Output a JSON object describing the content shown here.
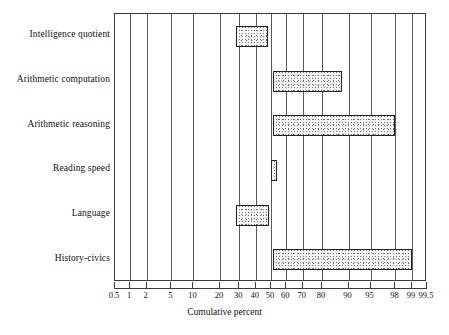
{
  "chart_data": {
    "type": "bar",
    "orientation": "horizontal",
    "title": "",
    "xlabel": "Cumulative percent",
    "ylabel": "",
    "scale": "normal-probability (probit)",
    "xlim": [
      0.5,
      99.5
    ],
    "grid": true,
    "legend": null,
    "xticks": [
      "0.5",
      "1",
      "2",
      "5",
      "10",
      "20",
      "30",
      "40",
      "50",
      "60",
      "70",
      "80",
      "90",
      "95",
      "98",
      "99",
      "99.5"
    ],
    "xtick_values": [
      0.5,
      1,
      2,
      5,
      10,
      20,
      30,
      40,
      50,
      60,
      70,
      80,
      90,
      95,
      98,
      99,
      99.5
    ],
    "categories": [
      "Intelligence quotient",
      "Arithmetic computation",
      "Arithmetic  reasoning",
      "Reading speed",
      "Language",
      "History-civics"
    ],
    "bars": [
      {
        "category": "Intelligence quotient",
        "start": 28,
        "end": 48
      },
      {
        "category": "Arithmetic computation",
        "start": 51,
        "end": 88
      },
      {
        "category": "Arithmetic  reasoning",
        "start": 51,
        "end": 98
      },
      {
        "category": "Reading speed",
        "start": 50,
        "end": 54
      },
      {
        "category": "Language",
        "start": 28,
        "end": 49
      },
      {
        "category": "History-civics",
        "start": 51,
        "end": 99
      }
    ],
    "colors": {
      "bar_fill": "#f4f4f2",
      "bar_edge": "#242424",
      "gridline": "#5a5a5a",
      "frame": "#3a3a3a",
      "text": "#111111",
      "background": "#ffffff"
    }
  }
}
